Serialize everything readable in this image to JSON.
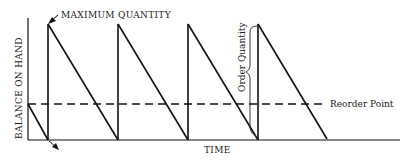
{
  "diagram": {
    "type": "inventory-sawtooth",
    "labels": {
      "max_quantity": "MAXIMUM QUANTITY",
      "y_axis": "BALANCE ON HAND",
      "x_axis": "TIME",
      "order_quantity": "Order Quantity",
      "reorder_point": "Reorder Point"
    },
    "colors": {
      "line": "#111111",
      "background": "#ffffff"
    },
    "cycles": 4,
    "annotations": [
      {
        "name": "max-quantity-arrow",
        "points_to": "first peak"
      },
      {
        "name": "zero-stock-arrow",
        "points_to": "first stock-out at baseline"
      },
      {
        "name": "order-quantity-brace",
        "spans": "baseline to peak of 4th cycle"
      }
    ]
  }
}
